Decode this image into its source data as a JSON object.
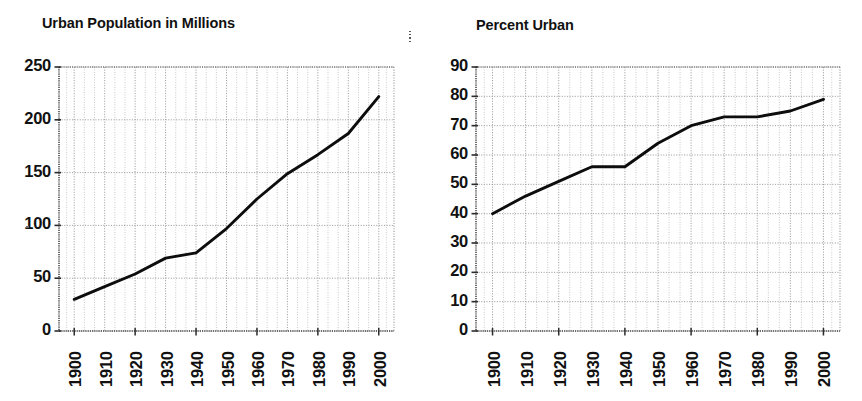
{
  "page": {
    "background": "#ffffff",
    "ink": "#000000",
    "grid_color": "#9a9a9a",
    "axis_color": "#4a4a4a",
    "series_color": "#0d0d0d",
    "width": 862,
    "height": 401
  },
  "artifacts": {
    "divider_dots_name": "scan-artifact-dots",
    "left_speck_name": "scan-artifact-speck"
  },
  "charts": [
    {
      "id": "urban-population",
      "title": "Urban Population in Millions"
    },
    {
      "id": "percent-urban",
      "title": "Percent Urban"
    }
  ],
  "chart_data": [
    {
      "type": "line",
      "title": "Urban Population in Millions",
      "xlabel": "",
      "ylabel": "",
      "categories": [
        "1900",
        "1910",
        "1920",
        "1930",
        "1940",
        "1950",
        "1960",
        "1970",
        "1980",
        "1990",
        "2000"
      ],
      "x": [
        1900,
        1910,
        1920,
        1930,
        1940,
        1950,
        1960,
        1970,
        1980,
        1990,
        2000
      ],
      "values": [
        30,
        42,
        54,
        69,
        74,
        97,
        125,
        149,
        167,
        187,
        222
      ],
      "ylim": [
        0,
        250
      ],
      "ytick_labels": [
        "0",
        "50",
        "100",
        "150",
        "200",
        "250"
      ],
      "ytick_values": [
        0,
        50,
        100,
        150,
        200,
        250
      ],
      "xtick_labels": [
        "1900",
        "1910",
        "1920",
        "1930",
        "1940",
        "1950",
        "1960",
        "1970",
        "1980",
        "1990",
        "2000"
      ],
      "xlim": [
        1895,
        2005
      ],
      "grid": true,
      "grid_style": "dotted",
      "minor_grid": true,
      "legend": "none",
      "series": [
        {
          "name": "Urban Population (millions)",
          "values": [
            30,
            42,
            54,
            69,
            74,
            97,
            125,
            149,
            167,
            187,
            222
          ]
        }
      ]
    },
    {
      "type": "line",
      "title": "Percent Urban",
      "xlabel": "",
      "ylabel": "",
      "categories": [
        "1900",
        "1910",
        "1920",
        "1930",
        "1940",
        "1950",
        "1960",
        "1970",
        "1980",
        "1990",
        "2000"
      ],
      "x": [
        1900,
        1910,
        1920,
        1930,
        1940,
        1950,
        1960,
        1970,
        1980,
        1990,
        2000
      ],
      "values": [
        40,
        46,
        51,
        56,
        56,
        64,
        70,
        73,
        73,
        75,
        79
      ],
      "ylim": [
        0,
        90
      ],
      "ytick_labels": [
        "0",
        "10",
        "20",
        "30",
        "40",
        "50",
        "60",
        "70",
        "80",
        "90"
      ],
      "ytick_values": [
        0,
        10,
        20,
        30,
        40,
        50,
        60,
        70,
        80,
        90
      ],
      "xtick_labels": [
        "1900",
        "1910",
        "1920",
        "1930",
        "1940",
        "1950",
        "1960",
        "1970",
        "1980",
        "1990",
        "2000"
      ],
      "xlim": [
        1895,
        2005
      ],
      "grid": true,
      "grid_style": "dotted",
      "minor_grid": true,
      "legend": "none",
      "series": [
        {
          "name": "Percent Urban",
          "values": [
            40,
            46,
            51,
            56,
            56,
            64,
            70,
            73,
            73,
            75,
            79
          ]
        }
      ]
    }
  ]
}
